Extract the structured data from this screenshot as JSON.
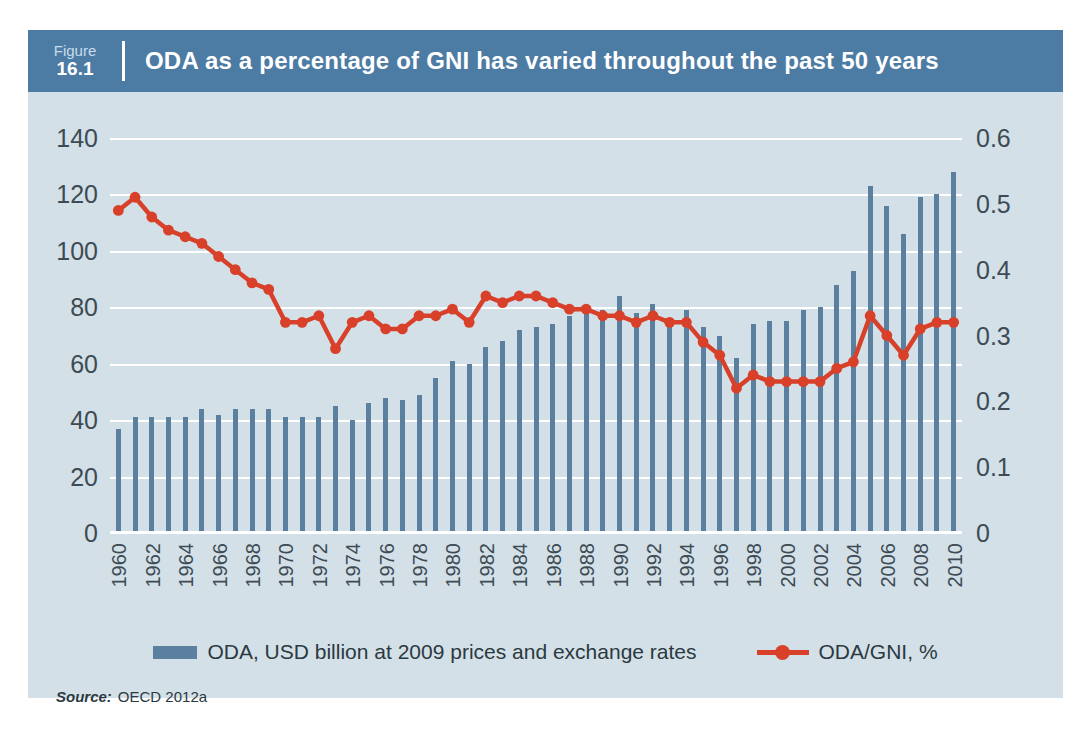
{
  "figure": {
    "label_word": "Figure",
    "number": "16.1",
    "title": "ODA as a percentage of GNI has varied throughout the past 50 years"
  },
  "source": {
    "label": "Source:",
    "text": "OECD 2012a"
  },
  "colors": {
    "panel_background": "#d3e0e8",
    "header_bar": "#4c7ba4",
    "bar_series": "#5b7f9e",
    "line_series": "#d8402a",
    "gridline": "#ffffff",
    "tick_text": "#3d4b54"
  },
  "chart_data": {
    "type": "bar",
    "title": "ODA as a percentage of GNI has varied throughout the past 50 years",
    "xlabel": "",
    "ylabel": "",
    "grid": true,
    "legend_position": "bottom",
    "x": [
      1960,
      1961,
      1962,
      1963,
      1964,
      1965,
      1966,
      1967,
      1968,
      1969,
      1970,
      1971,
      1972,
      1973,
      1974,
      1975,
      1976,
      1977,
      1978,
      1979,
      1980,
      1981,
      1982,
      1983,
      1984,
      1985,
      1986,
      1987,
      1988,
      1989,
      1990,
      1991,
      1992,
      1993,
      1994,
      1995,
      1996,
      1997,
      1998,
      1999,
      2000,
      2001,
      2002,
      2003,
      2004,
      2005,
      2006,
      2007,
      2008,
      2009,
      2010
    ],
    "xtick_labels": [
      "1960",
      "1962",
      "1964",
      "1966",
      "1968",
      "1970",
      "1972",
      "1974",
      "1976",
      "1978",
      "1980",
      "1982",
      "1984",
      "1986",
      "1988",
      "1990",
      "1992",
      "1994",
      "1996",
      "1998",
      "2000",
      "2002",
      "2004",
      "2006",
      "2008",
      "2010"
    ],
    "left_axis": {
      "label": "ODA, USD billion at 2009 prices and exchange rates",
      "ticks": [
        0,
        20,
        40,
        60,
        80,
        100,
        120,
        140
      ],
      "tick_labels": [
        "0",
        "20",
        "40",
        "60",
        "80",
        "100",
        "120",
        "140"
      ],
      "ylim": [
        0,
        140
      ]
    },
    "right_axis": {
      "label": "ODA/GNI, %",
      "ticks": [
        0,
        0.1,
        0.2,
        0.3,
        0.4,
        0.5,
        0.6
      ],
      "tick_labels": [
        "0",
        "0.1",
        "0.2",
        "0.3",
        "0.4",
        "0.5",
        "0.6"
      ],
      "ylim": [
        0,
        0.6
      ]
    },
    "series": [
      {
        "name": "ODA, USD billion at 2009 prices and exchange rates",
        "type": "bar",
        "axis": "left",
        "color": "#5b7f9e",
        "values": [
          37,
          41,
          41,
          41,
          41,
          44,
          42,
          44,
          44,
          44,
          41,
          41,
          41,
          45,
          40,
          46,
          48,
          47,
          49,
          55,
          61,
          60,
          66,
          68,
          72,
          73,
          74,
          77,
          80,
          79,
          84,
          78,
          81,
          75,
          79,
          73,
          70,
          62,
          74,
          75,
          75,
          79,
          80,
          88,
          93,
          123,
          116,
          106,
          119,
          120,
          128
        ]
      },
      {
        "name": "ODA/GNI, %",
        "type": "line",
        "axis": "right",
        "color": "#d8402a",
        "values": [
          0.49,
          0.51,
          0.48,
          0.46,
          0.45,
          0.44,
          0.42,
          0.4,
          0.38,
          0.37,
          0.32,
          0.32,
          0.33,
          0.28,
          0.32,
          0.33,
          0.31,
          0.31,
          0.33,
          0.33,
          0.34,
          0.32,
          0.36,
          0.35,
          0.36,
          0.36,
          0.35,
          0.34,
          0.34,
          0.33,
          0.33,
          0.32,
          0.33,
          0.32,
          0.32,
          0.29,
          0.27,
          0.22,
          0.24,
          0.23,
          0.23,
          0.23,
          0.23,
          0.25,
          0.26,
          0.33,
          0.3,
          0.27,
          0.31,
          0.32,
          0.32
        ]
      }
    ]
  },
  "legend": {
    "items": [
      {
        "marker": "bar-swatch-icon",
        "label": "ODA, USD billion at 2009 prices and exchange rates"
      },
      {
        "marker": "line-marker-icon",
        "label": "ODA/GNI, %"
      }
    ]
  }
}
